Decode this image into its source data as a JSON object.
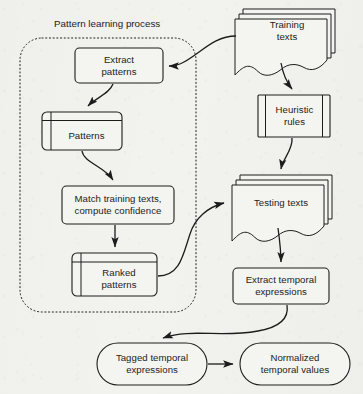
{
  "diagram": {
    "background_color": "#f2f2ef",
    "stroke_color": "#1c1c1c",
    "fill_color": "#f4f4f1",
    "groups": [
      {
        "id": "pattern-learning-process",
        "label": "Pattern learning process",
        "border_style": "dotted",
        "x": 20,
        "y": 38,
        "width": 176,
        "height": 274
      }
    ],
    "nodes": [
      {
        "id": "training-texts",
        "label": "Training\ntexts",
        "shape": "multi-document",
        "x": 237,
        "y": 8,
        "width": 100,
        "height": 56
      },
      {
        "id": "extract-patterns",
        "label": "Extract\npatterns",
        "shape": "rounded-rect",
        "x": 75,
        "y": 48,
        "width": 88,
        "height": 35
      },
      {
        "id": "patterns",
        "label": "Patterns",
        "shape": "internal-storage",
        "x": 42,
        "y": 112,
        "width": 80,
        "height": 38
      },
      {
        "id": "heuristic-rules",
        "label": "Heuristic\nrules",
        "shape": "predefined-process",
        "x": 258,
        "y": 95,
        "width": 72,
        "height": 42
      },
      {
        "id": "match-training-texts",
        "label": "Match training texts,\ncompute confidence",
        "shape": "rounded-rect",
        "x": 62,
        "y": 186,
        "width": 112,
        "height": 38
      },
      {
        "id": "testing-texts",
        "label": "Testing texts",
        "shape": "multi-document",
        "x": 234,
        "y": 174,
        "width": 100,
        "height": 56
      },
      {
        "id": "ranked-patterns",
        "label": "Ranked\npatterns",
        "shape": "internal-storage",
        "x": 72,
        "y": 253,
        "width": 85,
        "height": 43
      },
      {
        "id": "extract-temporal-expressions",
        "label": "Extract temporal\nexpressions",
        "shape": "rounded-rect",
        "x": 233,
        "y": 268,
        "width": 96,
        "height": 36
      },
      {
        "id": "tagged-temporal-expressions",
        "label": "Tagged temporal\nexpressions",
        "shape": "stadium",
        "x": 97,
        "y": 343,
        "width": 110,
        "height": 42
      },
      {
        "id": "normalized-temporal-values",
        "label": "Normalized\ntemporal values",
        "shape": "stadium",
        "x": 240,
        "y": 343,
        "width": 110,
        "height": 42
      }
    ],
    "edges": [
      {
        "id": "edge-training-to-extract",
        "from": "training-texts",
        "to": "extract-patterns",
        "style": "curved"
      },
      {
        "id": "edge-training-to-heuristic",
        "from": "training-texts",
        "to": "heuristic-rules",
        "style": "curved"
      },
      {
        "id": "edge-extract-to-patterns",
        "from": "extract-patterns",
        "to": "patterns",
        "style": "curved"
      },
      {
        "id": "edge-patterns-to-match",
        "from": "patterns",
        "to": "match-training-texts",
        "style": "curved"
      },
      {
        "id": "edge-heuristic-to-testing",
        "from": "heuristic-rules",
        "to": "testing-texts",
        "style": "curved"
      },
      {
        "id": "edge-match-to-ranked",
        "from": "match-training-texts",
        "to": "ranked-patterns",
        "style": "curved"
      },
      {
        "id": "edge-ranked-to-testing",
        "from": "ranked-patterns",
        "to": "testing-texts",
        "style": "curved"
      },
      {
        "id": "edge-testing-to-extracttemp",
        "from": "testing-texts",
        "to": "extract-temporal-expressions",
        "style": "curved"
      },
      {
        "id": "edge-extracttemp-to-tagged",
        "from": "extract-temporal-expressions",
        "to": "tagged-temporal-expressions",
        "style": "curved"
      },
      {
        "id": "edge-tagged-to-normalized",
        "from": "tagged-temporal-expressions",
        "to": "normalized-temporal-values",
        "style": "straight"
      }
    ]
  }
}
